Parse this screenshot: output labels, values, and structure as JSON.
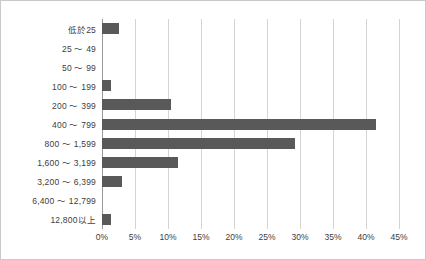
{
  "chart_data": {
    "type": "bar",
    "orientation": "horizontal",
    "title": "",
    "subtitle": "",
    "xlabel": "",
    "ylabel": "",
    "xlim": [
      0,
      45
    ],
    "ylim": null,
    "grid": true,
    "legend": null,
    "legend_position": "none",
    "value_unit": "%",
    "bar_color": "#595959",
    "gridline_color": "#d4d4d4",
    "axis_color": "#9a9a9a",
    "categories": [
      "低於25",
      "25 ～ 49",
      "50 ～ 99",
      "100 ～ 199",
      "200 ～ 399",
      "400 ～ 799",
      "800 ～ 1,599",
      "1,600 ～ 3,199",
      "3,200 ～ 6,399",
      "6,400 ～ 12,799",
      "12,800以上"
    ],
    "values": [
      2.6,
      0.0,
      0.0,
      1.4,
      10.5,
      41.5,
      29.3,
      11.5,
      3.0,
      0.0,
      1.3
    ],
    "xticks": [
      0,
      5,
      10,
      15,
      20,
      25,
      30,
      35,
      40,
      45
    ],
    "xticklabels": [
      "0%",
      "5%",
      "10%",
      "15%",
      "20%",
      "25%",
      "30%",
      "35%",
      "40%",
      "45%"
    ]
  }
}
